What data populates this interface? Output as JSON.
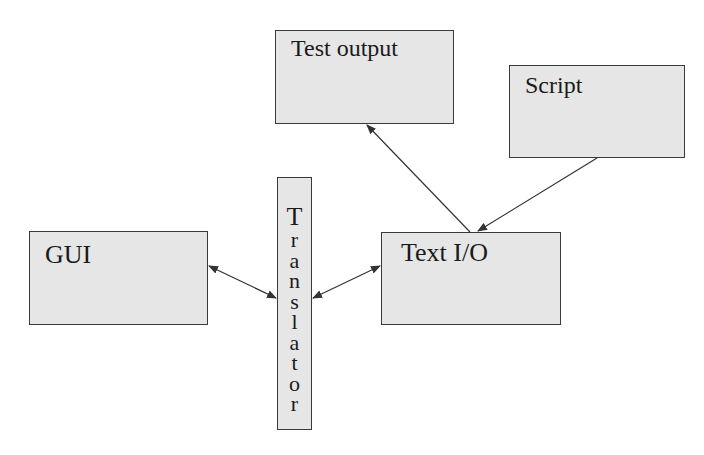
{
  "diagram": {
    "nodes": [
      {
        "id": "test_output",
        "label": "Test output"
      },
      {
        "id": "script",
        "label": "Script"
      },
      {
        "id": "gui",
        "label": "GUI"
      },
      {
        "id": "translator",
        "label": "Translator",
        "letters": [
          "T",
          "r",
          "a",
          "n",
          "s",
          "l",
          "a",
          "t",
          "o",
          "r"
        ]
      },
      {
        "id": "text_io",
        "label": "Text I/O"
      }
    ],
    "edges": [
      {
        "from": "text_io",
        "to": "test_output",
        "direction": "forward"
      },
      {
        "from": "script",
        "to": "text_io",
        "direction": "forward"
      },
      {
        "from": "gui",
        "to": "translator",
        "direction": "both"
      },
      {
        "from": "translator",
        "to": "text_io",
        "direction": "both"
      }
    ]
  },
  "colors": {
    "box_fill": "#e6e6e6",
    "box_border": "#3a3a3a",
    "line": "#333333"
  }
}
